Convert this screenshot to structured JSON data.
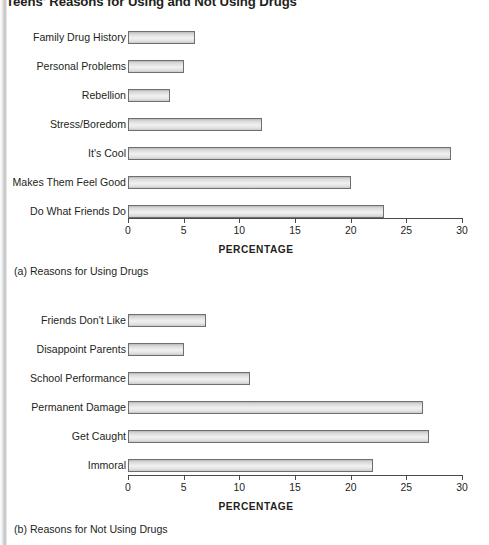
{
  "figure": {
    "title": "Teens' Reasons for Using and Not Using Drugs"
  },
  "panel_a": {
    "caption": "(a) Reasons for Using Drugs",
    "axis_title": "PERCENTAGE"
  },
  "panel_b": {
    "caption": "(b) Reasons for Not Using Drugs",
    "axis_title": "PERCENTAGE"
  },
  "chart_data": [
    {
      "type": "bar",
      "orientation": "horizontal",
      "title": "Teens' Reasons for Using and Not Using Drugs",
      "subtitle": "(a) Reasons for Using Drugs",
      "categories": [
        "Family Drug History",
        "Personal Problems",
        "Rebellion",
        "Stress/Boredom",
        "It's Cool",
        "Makes Them Feel Good",
        "Do What Friends Do"
      ],
      "values": [
        6,
        5,
        3.8,
        12,
        29,
        20,
        23
      ],
      "xlabel": "PERCENTAGE",
      "ylabel": "",
      "xlim": [
        0,
        30
      ],
      "xticks": [
        0,
        5,
        10,
        15,
        20,
        25,
        30
      ],
      "xtick_labels": [
        "0",
        "5",
        "10",
        "15",
        "20",
        "25",
        "30"
      ],
      "grid": false,
      "legend": false
    },
    {
      "type": "bar",
      "orientation": "horizontal",
      "title": "Teens' Reasons for Using and Not Using Drugs",
      "subtitle": "(b) Reasons for Not Using Drugs",
      "categories": [
        "Friends Don't Like",
        "Disappoint Parents",
        "School Performance",
        "Permanent Damage",
        "Get Caught",
        "Immoral"
      ],
      "values": [
        7,
        5,
        11,
        26.5,
        27,
        22
      ],
      "xlabel": "PERCENTAGE",
      "ylabel": "",
      "xlim": [
        0,
        30
      ],
      "xticks": [
        0,
        5,
        10,
        15,
        20,
        25,
        30
      ],
      "xtick_labels": [
        "0",
        "5",
        "10",
        "15",
        "20",
        "25",
        "30"
      ],
      "grid": false,
      "legend": false
    }
  ],
  "colors": {
    "bar_border": "#6f6f6f",
    "bar_fill": "#e9e9e9",
    "axis": "#4a4a4a",
    "text": "#231f20"
  }
}
